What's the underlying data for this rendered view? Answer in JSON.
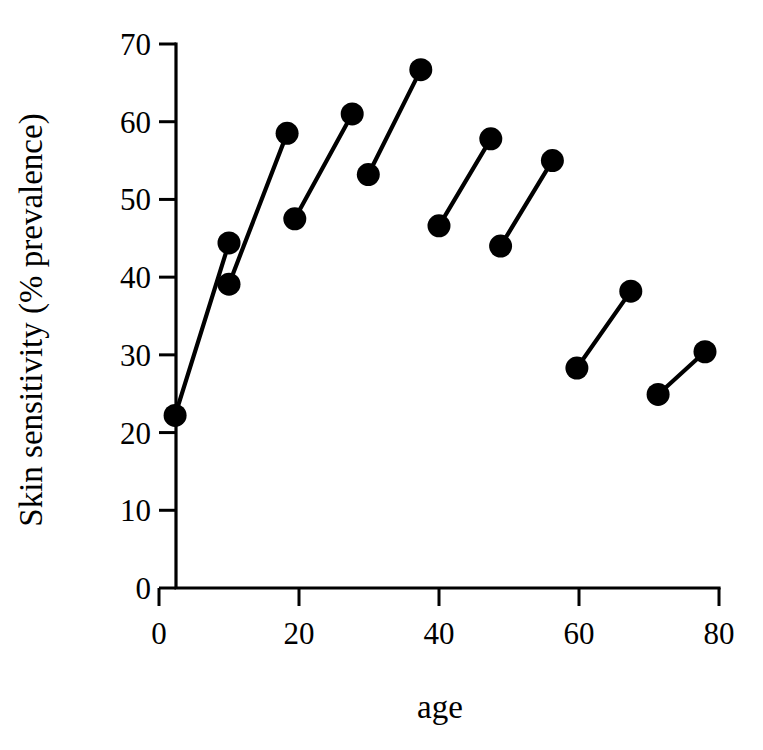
{
  "chart_data": {
    "type": "line",
    "title": "",
    "xlabel": "age",
    "ylabel": "Skin sensitivity (% prevalence)",
    "xlim": [
      0,
      80
    ],
    "ylim": [
      0,
      70
    ],
    "xticks": [
      0,
      20,
      40,
      60,
      80
    ],
    "yticks": [
      0,
      10,
      20,
      30,
      40,
      50,
      60,
      70
    ],
    "xtick_labels": [
      "0",
      "20",
      "40",
      "60",
      "80"
    ],
    "ytick_labels": [
      "0",
      "10",
      "20",
      "30",
      "40",
      "50",
      "60",
      "70"
    ],
    "grid": false,
    "legend": null,
    "marker": "filled-circle",
    "marker_color": "#000000",
    "line_color": "#000000",
    "points": [
      {
        "x": 2.3,
        "y": 22.2
      },
      {
        "x": 10.0,
        "y": 44.4
      },
      {
        "x": 10.0,
        "y": 39.1
      },
      {
        "x": 18.3,
        "y": 58.5
      },
      {
        "x": 19.4,
        "y": 47.5
      },
      {
        "x": 27.6,
        "y": 61.0
      },
      {
        "x": 29.9,
        "y": 53.2
      },
      {
        "x": 37.4,
        "y": 66.7
      },
      {
        "x": 40.0,
        "y": 46.6
      },
      {
        "x": 47.4,
        "y": 57.8
      },
      {
        "x": 48.8,
        "y": 44.0
      },
      {
        "x": 56.2,
        "y": 55.0
      },
      {
        "x": 59.7,
        "y": 28.3
      },
      {
        "x": 67.4,
        "y": 38.2
      },
      {
        "x": 71.3,
        "y": 24.9
      },
      {
        "x": 78.0,
        "y": 30.4
      }
    ],
    "segments": [
      {
        "x1": 2.3,
        "y1": 22.2,
        "x2": 10.0,
        "y2": 44.4
      },
      {
        "x1": 10.0,
        "y1": 39.1,
        "x2": 18.3,
        "y2": 58.5
      },
      {
        "x1": 19.4,
        "y1": 47.5,
        "x2": 27.6,
        "y2": 61.0
      },
      {
        "x1": 29.9,
        "y1": 53.2,
        "x2": 37.4,
        "y2": 66.7
      },
      {
        "x1": 40.0,
        "y1": 46.6,
        "x2": 47.4,
        "y2": 57.8
      },
      {
        "x1": 48.8,
        "y1": 44.0,
        "x2": 56.2,
        "y2": 55.0
      },
      {
        "x1": 59.7,
        "y1": 28.3,
        "x2": 67.4,
        "y2": 38.2
      },
      {
        "x1": 71.3,
        "y1": 24.9,
        "x2": 78.0,
        "y2": 30.4
      }
    ]
  }
}
